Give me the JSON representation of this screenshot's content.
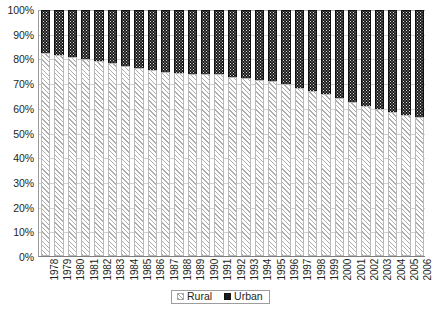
{
  "chart_data": {
    "type": "bar",
    "stacked": true,
    "stack_mode": "percent",
    "title": "",
    "subtitle": "",
    "xlabel": "",
    "ylabel": "",
    "ylim": [
      0,
      100
    ],
    "y_tick_labels": [
      "100%",
      "90%",
      "80%",
      "70%",
      "60%",
      "50%",
      "40%",
      "30%",
      "20%",
      "10%",
      "0%"
    ],
    "y_tick_values": [
      100,
      90,
      80,
      70,
      60,
      50,
      40,
      30,
      20,
      10,
      0
    ],
    "grid": true,
    "grid_axis": "y",
    "legend_position": "bottom-center",
    "categories": [
      "1978",
      "1979",
      "1980",
      "1981",
      "1982",
      "1983",
      "1984",
      "1985",
      "1986",
      "1987",
      "1988",
      "1989",
      "1990",
      "1991",
      "1992",
      "1993",
      "1994",
      "1995",
      "1996",
      "1997",
      "1998",
      "1999",
      "2000",
      "2001",
      "2002",
      "2003",
      "2004",
      "2005",
      "2006"
    ],
    "series": [
      {
        "name": "Rural",
        "pattern": "diagonal-hatch",
        "color": "#ffffff",
        "values": [
          82.1,
          81.4,
          80.6,
          79.8,
          78.9,
          78.3,
          77.0,
          76.3,
          75.3,
          74.6,
          74.0,
          73.6,
          73.6,
          73.6,
          72.6,
          72.0,
          71.4,
          70.9,
          69.5,
          68.1,
          66.7,
          65.4,
          63.8,
          62.3,
          60.9,
          59.5,
          58.2,
          57.0,
          56.1
        ]
      },
      {
        "name": "Urban",
        "pattern": "dotted-dark",
        "color": "#1b1b1b",
        "values": [
          17.9,
          18.6,
          19.4,
          20.2,
          21.1,
          21.7,
          23.0,
          23.7,
          24.7,
          25.4,
          26.0,
          26.4,
          26.4,
          26.4,
          27.4,
          28.0,
          28.6,
          29.1,
          30.5,
          31.9,
          33.3,
          34.6,
          36.2,
          37.7,
          39.1,
          40.5,
          41.8,
          43.0,
          43.9
        ]
      }
    ]
  },
  "legend": {
    "items": [
      {
        "label": "Rural",
        "icon": "hatched-swatch-icon"
      },
      {
        "label": "Urban",
        "icon": "dark-swatch-icon"
      }
    ]
  },
  "colors": {
    "urban": "#1b1b1b",
    "rural": "#ffffff",
    "gridline": "#d2d2d2",
    "axis": "#7d7d7d",
    "text": "#231f20"
  }
}
